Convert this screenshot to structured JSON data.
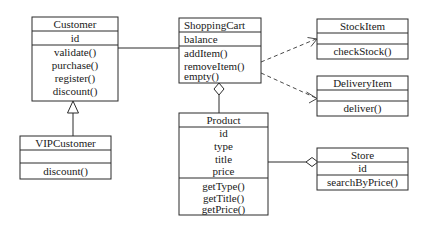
{
  "diagram": {
    "type": "uml-class-diagram",
    "classes": [
      {
        "id": "customer",
        "name": "Customer",
        "attributes": [
          "id"
        ],
        "operations": [
          "validate()",
          "purchase()",
          "register()",
          "discount()"
        ],
        "align": "center"
      },
      {
        "id": "vipcustomer",
        "name": "VIPCustomer",
        "attributes": [],
        "operations": [
          "discount()"
        ],
        "align": "center"
      },
      {
        "id": "shoppingcart",
        "name": "ShoppingCart",
        "attributes": [
          "balance"
        ],
        "operations": [
          "addItem()",
          "removeItem()",
          "empty()"
        ],
        "align": "left"
      },
      {
        "id": "product",
        "name": "Product",
        "attributes": [
          "id",
          "type",
          "title",
          "price"
        ],
        "operations": [
          "getType()",
          "getTitle()",
          "getPrice()"
        ],
        "align": "center"
      },
      {
        "id": "stockitem",
        "name": "StockItem",
        "attributes": [],
        "operations": [
          "checkStock()"
        ],
        "align": "center"
      },
      {
        "id": "deliveryitem",
        "name": "DeliveryItem",
        "attributes": [],
        "operations": [
          "deliver()"
        ],
        "align": "center"
      },
      {
        "id": "store",
        "name": "Store",
        "attributes": [
          "id"
        ],
        "operations": [
          "searchByPrice()"
        ],
        "align": "center"
      }
    ],
    "relationships": [
      {
        "id": "rel-generalization-vip-customer",
        "kind": "generalization",
        "from": "vipcustomer",
        "to": "customer"
      },
      {
        "id": "rel-association-customer-cart",
        "kind": "association",
        "from": "customer",
        "to": "shoppingcart"
      },
      {
        "id": "rel-dependency-cart-stockitem",
        "kind": "dependency",
        "from": "shoppingcart",
        "to": "stockitem"
      },
      {
        "id": "rel-dependency-cart-deliveryitem",
        "kind": "dependency",
        "from": "shoppingcart",
        "to": "deliveryitem"
      },
      {
        "id": "rel-aggregation-cart-product",
        "kind": "aggregation",
        "from": "shoppingcart",
        "to": "product"
      },
      {
        "id": "rel-aggregation-store-product",
        "kind": "aggregation",
        "from": "store",
        "to": "product"
      }
    ],
    "colors": {
      "background": "#ffffff",
      "border": "#2b2b2b",
      "text": "#1a1a1a",
      "dependency": "#4a4a4a"
    }
  }
}
